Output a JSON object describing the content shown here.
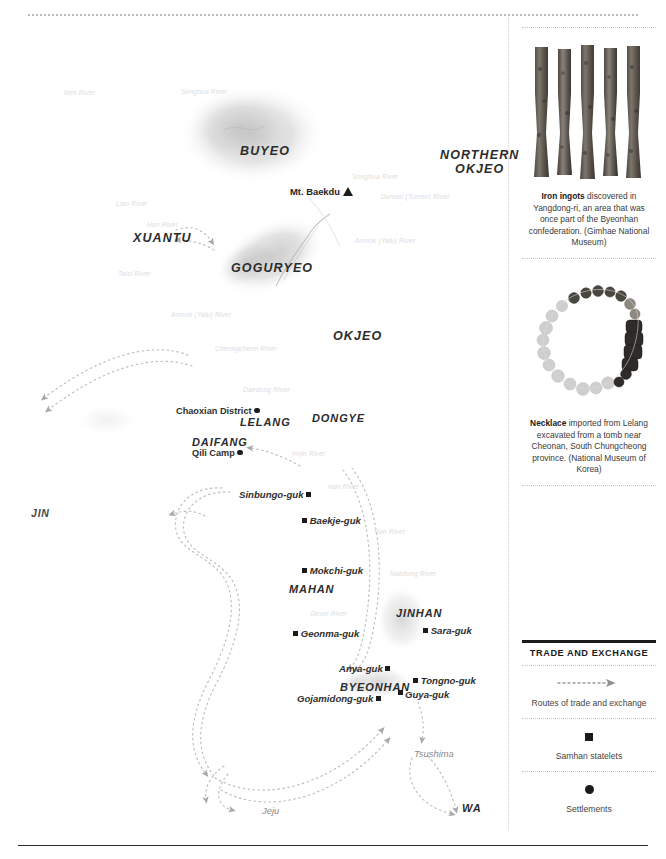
{
  "map": {
    "polities": [
      {
        "name": "BUYEO",
        "x": 240,
        "y": 113
      },
      {
        "name": "NORTHERN\nOKJEO",
        "x": 440,
        "y": 127
      },
      {
        "name": "XUANTU",
        "x": 135,
        "y": 205
      },
      {
        "name": "GOGURYEO",
        "x": 232,
        "y": 236
      },
      {
        "name": "OKJEO",
        "x": 334,
        "y": 303
      },
      {
        "name": "LELANG",
        "x": 240,
        "y": 390
      },
      {
        "name": "DONGYE",
        "x": 313,
        "y": 387
      },
      {
        "name": "DAIFANG",
        "x": 193,
        "y": 411
      },
      {
        "name": "MAHAN",
        "x": 290,
        "y": 558
      },
      {
        "name": "JINHAN",
        "x": 397,
        "y": 582
      },
      {
        "name": "BYEONHAN",
        "x": 341,
        "y": 656
      },
      {
        "name": "JIN",
        "x": 31,
        "y": 502
      },
      {
        "name": "WA",
        "x": 463,
        "y": 797
      }
    ],
    "settlements": [
      {
        "name": "Chaoxian District",
        "x": 178,
        "y": 389,
        "marker": "dot",
        "side": "left"
      },
      {
        "name": "Qili Camp",
        "x": 193,
        "y": 430,
        "marker": "dot",
        "side": "left"
      }
    ],
    "statelets": [
      {
        "name": "Sinbungo-guk",
        "x": 240,
        "y": 472,
        "marker": "square",
        "side": "left"
      },
      {
        "name": "Baekje-guk",
        "x": 303,
        "y": 498,
        "marker": "square",
        "side": "right"
      },
      {
        "name": "Mokchi-guk",
        "x": 303,
        "y": 548,
        "marker": "square",
        "side": "right"
      },
      {
        "name": "Geonma-guk",
        "x": 294,
        "y": 611,
        "marker": "square",
        "side": "right"
      },
      {
        "name": "Sara-guk",
        "x": 424,
        "y": 608,
        "marker": "square",
        "side": "right"
      },
      {
        "name": "Anya-guk",
        "x": 340,
        "y": 646,
        "marker": "square",
        "side": "left"
      },
      {
        "name": "Tongno-guk",
        "x": 414,
        "y": 658,
        "marker": "square",
        "side": "right"
      },
      {
        "name": "Guya-guk",
        "x": 406,
        "y": 671,
        "marker": "square",
        "side": "left"
      },
      {
        "name": "Gojamidong-guk",
        "x": 298,
        "y": 676,
        "marker": "square",
        "side": "left"
      }
    ],
    "mountain": {
      "name": "Mt. Baekdu",
      "x": 307,
      "y": 186
    },
    "islands": [
      {
        "name": "Tsushima",
        "x": 415,
        "y": 731
      },
      {
        "name": "Jeju",
        "x": 263,
        "y": 788
      }
    ],
    "rivers": [
      {
        "name": "Nen River",
        "x": 64,
        "y": 71,
        "rot": 0
      },
      {
        "name": "Songhua River",
        "x": 181,
        "y": 70,
        "rot": 0
      },
      {
        "name": "Songhua River",
        "x": 352,
        "y": 155,
        "rot": 0
      },
      {
        "name": "Duman (Tumen) River",
        "x": 381,
        "y": 175,
        "rot": 0
      },
      {
        "name": "Liao River",
        "x": 116,
        "y": 182,
        "rot": 0
      },
      {
        "name": "Hun River",
        "x": 147,
        "y": 203,
        "rot": 0
      },
      {
        "name": "Amnok (Yalu) River",
        "x": 355,
        "y": 219,
        "rot": 0
      },
      {
        "name": "Taizi River",
        "x": 118,
        "y": 252,
        "rot": 0
      },
      {
        "name": "Amnok (Yalu) River",
        "x": 171,
        "y": 293,
        "rot": 0
      },
      {
        "name": "Cheongcheon River",
        "x": 215,
        "y": 327,
        "rot": 0
      },
      {
        "name": "Daedong River",
        "x": 243,
        "y": 368,
        "rot": 0
      },
      {
        "name": "Imjin River",
        "x": 292,
        "y": 432,
        "rot": 0
      },
      {
        "name": "Han River",
        "x": 328,
        "y": 465,
        "rot": 0
      },
      {
        "name": "Han River",
        "x": 374,
        "y": 510,
        "rot": 0
      },
      {
        "name": "Nakdong River",
        "x": 390,
        "y": 552,
        "rot": 0
      },
      {
        "name": "Geum River",
        "x": 310,
        "y": 592,
        "rot": 0
      }
    ]
  },
  "sidebar": {
    "figures": [
      {
        "name": "iron-ingots",
        "caption_lead": "Iron ingots",
        "caption_rest": " discovered in Yangdong-ri, an area that was once part of the Byeonhan confederation. (Gimhae National Museum)"
      },
      {
        "name": "necklace",
        "caption_lead": "Necklace",
        "caption_rest": " imported from Lelang excavated from a tomb near Cheonan, South Chungcheong province. (National Museum of Korea)"
      }
    ],
    "legend": {
      "title": "TRADE AND EXCHANGE",
      "items": [
        {
          "icon": "dotted-arrow",
          "label": "Routes of trade and exchange"
        },
        {
          "icon": "square",
          "label": "Samhan statelets"
        },
        {
          "icon": "dot",
          "label": "Settlements"
        }
      ]
    }
  },
  "colors": {
    "ink": "#231f20",
    "faint_river": "#dcdcdc",
    "route": "#bdbdbd",
    "territory": "#d8d8d8"
  }
}
